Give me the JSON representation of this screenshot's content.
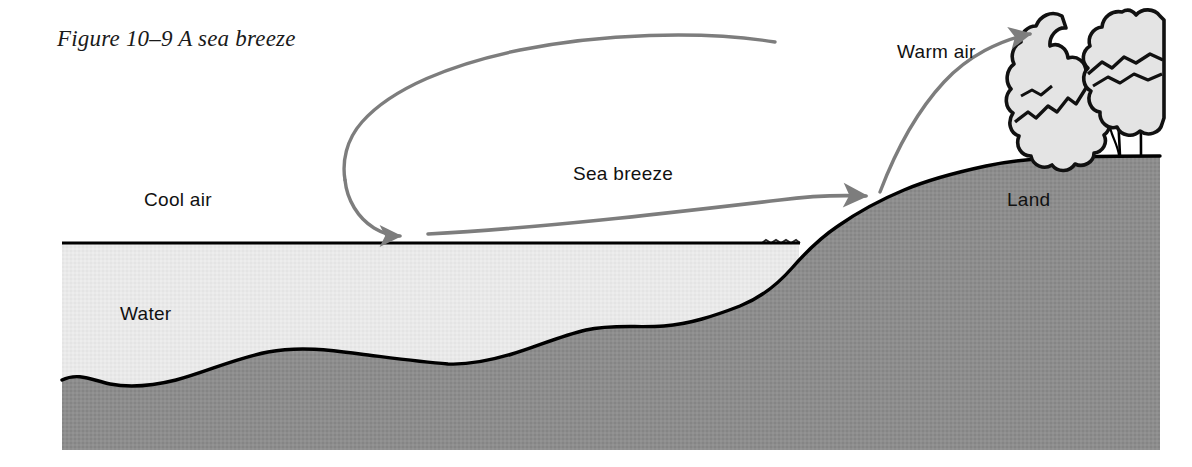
{
  "figure": {
    "caption": "Figure 10–9 A sea breeze",
    "labels": {
      "warm_air": "Warm air",
      "cool_air": "Cool air",
      "sea_breeze": "Sea breeze",
      "land": "Land",
      "water": "Water"
    }
  },
  "colors": {
    "background": "#ffffff",
    "water_fill": "#e9e9e9",
    "land_fill": "#8d8d8d",
    "outline": "#000000",
    "arrow": "#7d7d7d",
    "tree_canopy": "#e4e4e4",
    "text": "#111111"
  },
  "diagram_data": {
    "type": "diagram",
    "subject": "sea breeze circulation",
    "description": "Cross-section of a coastline showing a daytime sea breeze circulation cell: cool air sinks over the water, flows inland across the surface as the sea breeze, rises over the warm land, and returns seaward aloft as warm air.",
    "regions": [
      {
        "name": "water",
        "label": "Water",
        "fill": "#e9e9e9",
        "side": "left"
      },
      {
        "name": "land",
        "label": "Land",
        "fill": "#8d8d8d",
        "side": "right"
      },
      {
        "name": "seabed",
        "label": "",
        "fill": "#8d8d8d",
        "side": "below water"
      }
    ],
    "air_masses": [
      {
        "name": "cool_air",
        "label": "Cool air",
        "position": "over the water, left"
      },
      {
        "name": "warm_air",
        "label": "Warm air",
        "position": "over the land, upper right"
      }
    ],
    "flow": {
      "label": "Sea breeze",
      "shape": "clockwise-when-viewed-as-drawn circulation loop",
      "segments": [
        {
          "name": "descending-limb",
          "from": "upper left of loop",
          "to": "water surface",
          "arrow": "arrowhead pointing right toward the sea surface"
        },
        {
          "name": "surface-inflow",
          "from": "over the water",
          "to": "shoreline",
          "arrow": "arrowhead pointing up-right at the shore"
        },
        {
          "name": "ascending-limb",
          "from": "shoreline",
          "to": "top of loop",
          "arrow": "none"
        },
        {
          "name": "return-flow-aloft",
          "from": "over the land aloft",
          "to": "seaward",
          "arrow": "arrowhead pointing left"
        }
      ]
    },
    "vegetation": {
      "name": "trees",
      "count": 3,
      "position": "on the land at the upper right"
    }
  }
}
